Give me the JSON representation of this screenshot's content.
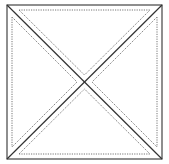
{
  "diagram": {
    "type": "square-with-diagonals",
    "outer_square": {
      "x1": 7,
      "y1": 5,
      "x2": 162,
      "y2": 159
    },
    "colors": {
      "solid": "#333333",
      "dotted": "#555555",
      "background": "#ffffff"
    },
    "inner_triangles": [
      {
        "name": "top",
        "points": "19,10 150,10 85,75"
      },
      {
        "name": "bottom",
        "points": "19,154 150,154 85,89"
      },
      {
        "name": "left",
        "points": "12,17 12,148 77,82"
      },
      {
        "name": "right",
        "points": "157,17 157,148 92,82"
      }
    ]
  }
}
